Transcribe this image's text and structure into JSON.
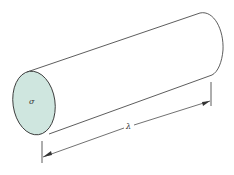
{
  "diagram": {
    "title": "",
    "shape": "cylinder",
    "labels": {
      "cross_section": "σ",
      "length": "λ"
    },
    "colors": {
      "end_face_fill": "#cfe6df",
      "stroke": "#333333",
      "background": "#ffffff"
    }
  }
}
